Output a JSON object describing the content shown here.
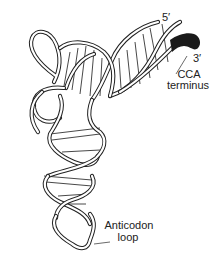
{
  "diagram": {
    "labels": {
      "five_prime": "5′",
      "three_prime": "3′",
      "cca_line1": "CCA",
      "cca_line2": "terminus",
      "anticodon_line1": "Anticodon",
      "anticodon_line2": "loop"
    },
    "colors": {
      "line": "#222222",
      "background": "#ffffff",
      "terminus": "#1a1a1a"
    }
  }
}
